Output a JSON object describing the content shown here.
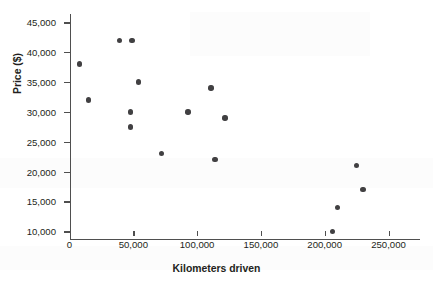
{
  "chart_data": {
    "type": "scatter",
    "title": "",
    "xlabel": "Kilometers driven",
    "ylabel": "Price ($)",
    "xlim": [
      0,
      262000
    ],
    "ylim": [
      9000,
      46500
    ],
    "grid": false,
    "legend": null,
    "xticks": [
      0,
      50000,
      100000,
      150000,
      200000,
      250000
    ],
    "xtick_labels": [
      "0",
      "50,000",
      "100,000",
      "150,000",
      "200,000",
      "250,000"
    ],
    "yticks": [
      10000,
      15000,
      20000,
      25000,
      30000,
      35000,
      40000,
      45000
    ],
    "ytick_labels": [
      "10,000",
      "15,000",
      "20,000",
      "25,000",
      "30,000",
      "35,000",
      "40,000",
      "45,000"
    ],
    "marker_color": "#414042",
    "axis_color": "#4f4f4f",
    "points": [
      {
        "x": 8000,
        "y": 38000
      },
      {
        "x": 15000,
        "y": 32000
      },
      {
        "x": 39000,
        "y": 42000
      },
      {
        "x": 49000,
        "y": 42000
      },
      {
        "x": 54000,
        "y": 35000
      },
      {
        "x": 48000,
        "y": 30000
      },
      {
        "x": 48000,
        "y": 27500
      },
      {
        "x": 72000,
        "y": 23000
      },
      {
        "x": 93000,
        "y": 30000
      },
      {
        "x": 111000,
        "y": 34000
      },
      {
        "x": 114000,
        "y": 22000
      },
      {
        "x": 122000,
        "y": 29000
      },
      {
        "x": 206000,
        "y": 10000
      },
      {
        "x": 210000,
        "y": 14000
      },
      {
        "x": 225000,
        "y": 21000
      },
      {
        "x": 230000,
        "y": 17000
      }
    ]
  }
}
